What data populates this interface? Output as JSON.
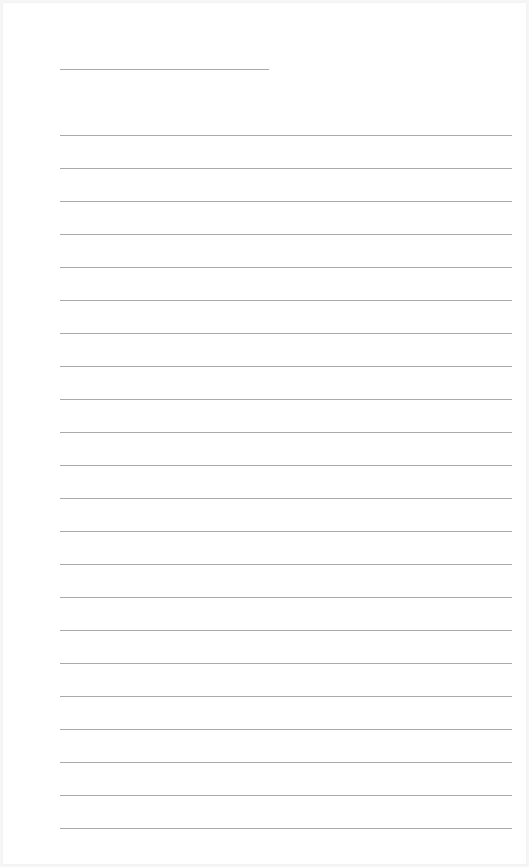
{
  "page": {
    "type": "blank lined writing paper",
    "background": "#ffffff",
    "line_color": "#a9a9a9"
  },
  "header_line": {
    "x": 60,
    "y": 69,
    "width": 209
  },
  "ruled_lines": {
    "x": 60,
    "width": 452,
    "start_y": 135,
    "spacing": 33,
    "count": 22
  }
}
